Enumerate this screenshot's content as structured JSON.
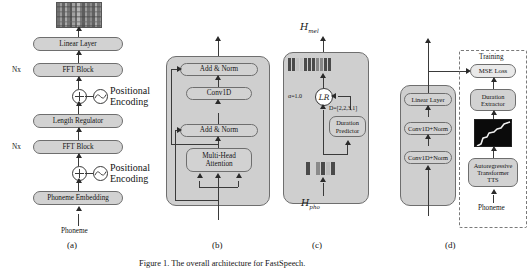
{
  "figure": {
    "caption": "Figure 1.   The overall architecture for FastSpeech.",
    "panel_labels": {
      "a": "(a)",
      "b": "(b)",
      "c": "(c)",
      "d": "(d)"
    }
  },
  "panel_a": {
    "name": "FastSpeech overall architecture",
    "top_output_label": "",
    "blocks": [
      {
        "id": "linear_layer",
        "label": "Linear Layer"
      },
      {
        "id": "fft_block_top",
        "label": "FFT Block"
      },
      {
        "id": "length_regulator",
        "label": "Length Regulator"
      },
      {
        "id": "fft_block_bottom",
        "label": "FFT Block"
      },
      {
        "id": "phoneme_embedding",
        "label": "Phoneme Embedding"
      }
    ],
    "repeat_label_top": "Nx",
    "repeat_label_bottom": "Nx",
    "positional_encoding_top": "Positional\nEncoding",
    "positional_encoding_top_line1": "Positional",
    "positional_encoding_top_line2": "Encoding",
    "positional_encoding_bottom_line1": "Positional",
    "positional_encoding_bottom_line2": "Encoding",
    "input_label": "Phoneme",
    "spectrogram_alt": "mel-spectrogram"
  },
  "panel_b": {
    "name": "FFT Block",
    "blocks": [
      {
        "id": "add_norm_top",
        "label": "Add & Norm"
      },
      {
        "id": "conv1d",
        "label": "Conv1D"
      },
      {
        "id": "add_norm_bottom",
        "label": "Add & Norm"
      },
      {
        "id": "multi_head_attention_line1",
        "label": "Multi-Head"
      },
      {
        "id": "multi_head_attention_line2",
        "label": "Attention"
      }
    ]
  },
  "panel_c": {
    "name": "Length Regulator",
    "output_symbol": "H",
    "output_subscript": "mel",
    "input_symbol": "H",
    "input_subscript": "pho",
    "alpha_label": "α=1.0",
    "lr_label": "LR",
    "duration_label": "D=[2,2,3,1]",
    "duration_predictor_line1": "Duration",
    "duration_predictor_line2": "Predictor",
    "output_bars": 8,
    "input_bars": 4,
    "durations": [
      2,
      2,
      3,
      1
    ]
  },
  "panel_d": {
    "name": "Duration Predictor",
    "blocks": [
      {
        "id": "linear_layer",
        "label": "Linear Layer"
      },
      {
        "id": "conv1d_norm_top",
        "label": "Conv1D+Norm"
      },
      {
        "id": "conv1d_norm_bottom",
        "label": "Conv1D+Norm"
      }
    ],
    "training_label": "Training",
    "training_blocks": [
      {
        "id": "mse_loss",
        "label": "MSE Loss"
      },
      {
        "id": "duration_extractor_line1",
        "label": "Duration"
      },
      {
        "id": "duration_extractor_line2",
        "label": "Extractor"
      },
      {
        "id": "ar_tts_line1",
        "label": "Autoregressive"
      },
      {
        "id": "ar_tts_line2",
        "label": "Transformer"
      },
      {
        "id": "ar_tts_line3",
        "label": "TTS"
      }
    ],
    "input_label": "Phoneme",
    "attention_alignment_alt": "attention alignment"
  },
  "colors": {
    "box_fill": "#d2d2d2",
    "box_stroke": "#6e6e6e",
    "panel_fill": "#cfcfcf",
    "arrow": "#2a2a2a",
    "dash_stroke": "#7a7a7a",
    "bar_dark": "#4a4a4a",
    "bar_light": "#cfcfcf",
    "background": "#ffffff"
  }
}
